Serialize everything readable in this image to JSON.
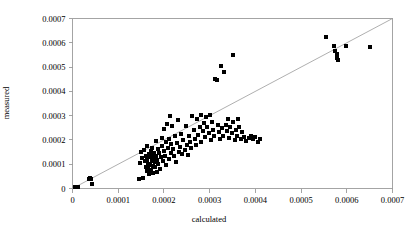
{
  "chart_data": {
    "type": "scatter",
    "title": "",
    "xlabel": "calculated",
    "ylabel": "measured",
    "xlim": [
      0,
      0.0007
    ],
    "ylim": [
      0,
      0.0007
    ],
    "xticks": [
      0,
      0.0001,
      0.0002,
      0.0003,
      0.0004,
      0.0005,
      0.0006,
      0.0007
    ],
    "yticks": [
      0,
      0.0001,
      0.0002,
      0.0003,
      0.0004,
      0.0005,
      0.0006,
      0.0007
    ],
    "xticklabels": [
      "0",
      "0.0001",
      "0.0002",
      "0.0003",
      "0.0004",
      "0.0005",
      "0.0006",
      "0.0007"
    ],
    "yticklabels": [
      "0",
      "0.0001",
      "0.0002",
      "0.0003",
      "0.0004",
      "0.0005",
      "0.0006",
      "0.0007"
    ],
    "grid": false,
    "legend": false,
    "marker": "square",
    "marker_color": "#000000",
    "marker_size": 4,
    "reference_line": {
      "name": "identity-line",
      "from": [
        0,
        0
      ],
      "to": [
        0.0007,
        0.0007
      ],
      "color": "#9a9a9a",
      "width": 0.8
    },
    "frame_color": "#9a9a9a",
    "series": [
      {
        "name": "samples",
        "points": [
          [
            5e-06,
            8e-06
          ],
          [
            1.2e-05,
            6e-06
          ],
          [
            3.5e-05,
            4e-05
          ],
          [
            3.8e-05,
            4.3e-05
          ],
          [
            4e-05,
            4.1e-05
          ],
          [
            4.2e-05,
            2e-05
          ],
          [
            0.000145,
            4e-05
          ],
          [
            0.000148,
            0.000105
          ],
          [
            0.00015,
            0.00015
          ],
          [
            0.000152,
            0.000125
          ],
          [
            0.000155,
            4.5e-05
          ],
          [
            0.000156,
            0.00016
          ],
          [
            0.000158,
            0.000115
          ],
          [
            0.00016,
            9e-05
          ],
          [
            0.00016,
            0.000135
          ],
          [
            0.000162,
            7.2e-05
          ],
          [
            0.000163,
            0.000175
          ],
          [
            0.000164,
            0.000118
          ],
          [
            0.000165,
            8.5e-05
          ],
          [
            0.000166,
            0.000102
          ],
          [
            0.000167,
            0.000142
          ],
          [
            0.000168,
            6e-05
          ],
          [
            0.000169,
            0.000128
          ],
          [
            0.00017,
            9.8e-05
          ],
          [
            0.000171,
            0.000155
          ],
          [
            0.000172,
            7.8e-05
          ],
          [
            0.000173,
            0.000112
          ],
          [
            0.000174,
            0.000168
          ],
          [
            0.000175,
            9.2e-05
          ],
          [
            0.000176,
            0.000138
          ],
          [
            0.000177,
            6.5e-05
          ],
          [
            0.000178,
            0.000122
          ],
          [
            0.000179,
            0.000148
          ],
          [
            0.00018,
            8.8e-05
          ],
          [
            0.000181,
            0.000108
          ],
          [
            0.000182,
            0.000195
          ],
          [
            0.000183,
            0.000132
          ],
          [
            0.000184,
            7e-05
          ],
          [
            0.000185,
            0.000118
          ],
          [
            0.000186,
            0.000162
          ],
          [
            0.000188,
            0.0001
          ],
          [
            0.00019,
            0.000145
          ],
          [
            0.000192,
            8.2e-05
          ],
          [
            0.000194,
            0.000128
          ],
          [
            0.000195,
            0.00021
          ],
          [
            0.000196,
            0.000175
          ],
          [
            0.000198,
            0.000112
          ],
          [
            0.0002,
            0.000155
          ],
          [
            0.000201,
            0.000245
          ],
          [
            0.000202,
            0.000135
          ],
          [
            0.000204,
            0.00019
          ],
          [
            0.000205,
            9.5e-05
          ],
          [
            0.000206,
            0.000265
          ],
          [
            0.000208,
            0.000168
          ],
          [
            0.00021,
            0.000122
          ],
          [
            0.000212,
            0.000205
          ],
          [
            0.000214,
            0.000298
          ],
          [
            0.000215,
            0.000148
          ],
          [
            0.000216,
            0.000182
          ],
          [
            0.000218,
            0.000258
          ],
          [
            0.00022,
            0.000162
          ],
          [
            0.000222,
            0.000132
          ],
          [
            0.000224,
            0.000215
          ],
          [
            0.000226,
            0.000108
          ],
          [
            0.000228,
            0.000188
          ],
          [
            0.00023,
            0.000282
          ],
          [
            0.000232,
            0.000152
          ],
          [
            0.000235,
            0.000172
          ],
          [
            0.000238,
            0.000225
          ],
          [
            0.00024,
            0.000142
          ],
          [
            0.000242,
            0.000198
          ],
          [
            0.000245,
            0.00016
          ],
          [
            0.000248,
            0.000258
          ],
          [
            0.00025,
            0.000178
          ],
          [
            0.000252,
            0.000138
          ],
          [
            0.000255,
            0.000215
          ],
          [
            0.000258,
            0.000192
          ],
          [
            0.00026,
            0.000165
          ],
          [
            0.000262,
            0.000298
          ],
          [
            0.000265,
            0.000242
          ],
          [
            0.000268,
            0.000205
          ],
          [
            0.00027,
            0.000178
          ],
          [
            0.000272,
            0.000285
          ],
          [
            0.000275,
            0.000222
          ],
          [
            0.000278,
            0.000255
          ],
          [
            0.00028,
            0.000192
          ],
          [
            0.000282,
            0.000302
          ],
          [
            0.000285,
            0.000238
          ],
          [
            0.000288,
            0.000268
          ],
          [
            0.00029,
            0.000212
          ],
          [
            0.000292,
            0.000295
          ],
          [
            0.000295,
            0.000252
          ],
          [
            0.000298,
            0.000228
          ],
          [
            0.0003,
            0.000302
          ],
          [
            0.000302,
            0.000198
          ],
          [
            0.000305,
            0.000272
          ],
          [
            0.000308,
            0.000242
          ],
          [
            0.00031,
            0.000218
          ],
          [
            0.000312,
            0.000452
          ],
          [
            0.000315,
            0.000445
          ],
          [
            0.000318,
            0.000262
          ],
          [
            0.00032,
            0.000232
          ],
          [
            0.000322,
            0.000205
          ],
          [
            0.000325,
            0.000505
          ],
          [
            0.000328,
            0.000248
          ],
          [
            0.00033,
            0.000218
          ],
          [
            0.000332,
            0.000478
          ],
          [
            0.000335,
            0.000262
          ],
          [
            0.000338,
            0.000235
          ],
          [
            0.00034,
            0.000288
          ],
          [
            0.000342,
            0.000208
          ],
          [
            0.000345,
            0.000255
          ],
          [
            0.000348,
            0.000228
          ],
          [
            0.00035,
            0.000548
          ],
          [
            0.000352,
            0.000272
          ],
          [
            0.000355,
            0.000198
          ],
          [
            0.000358,
            0.000242
          ],
          [
            0.00036,
            0.000218
          ],
          [
            0.000362,
            0.000285
          ],
          [
            0.000365,
            0.000255
          ],
          [
            0.000368,
            0.000205
          ],
          [
            0.00037,
            0.000232
          ],
          [
            0.000375,
            0.000212
          ],
          [
            0.00038,
            0.000195
          ],
          [
            0.000385,
            0.000208
          ],
          [
            0.00039,
            0.000218
          ],
          [
            0.000395,
            0.000202
          ],
          [
            0.0004,
            0.000212
          ],
          [
            0.000405,
            0.00019
          ],
          [
            0.00041,
            0.000205
          ],
          [
            0.000555,
            0.000625
          ],
          [
            0.000572,
            0.000585
          ],
          [
            0.000575,
            0.000565
          ],
          [
            0.000578,
            0.000552
          ],
          [
            0.000578,
            0.000538
          ],
          [
            0.00058,
            0.000528
          ],
          [
            0.000598,
            0.000588
          ],
          [
            0.00065,
            0.000582
          ]
        ]
      }
    ]
  }
}
